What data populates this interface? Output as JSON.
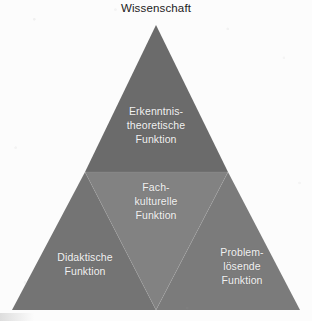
{
  "figure": {
    "title": "Wissenschaft",
    "shape": "triangle-pyramid",
    "background_color": "#fcfcfc",
    "title_color": "#222222",
    "label_color": "#f2f2f2",
    "regions": [
      {
        "id": "epistemic",
        "label": "Erkenntnis-\ntheoretische\nFunktion",
        "position": "top",
        "fill_color": "#6b6b6b"
      },
      {
        "id": "cultural",
        "label": "Fach-\nkulturelle\nFunktion",
        "position": "middle",
        "fill_color": "#828282"
      },
      {
        "id": "didactic",
        "label": "Didaktische\nFunktion",
        "position": "bottom-left",
        "fill_color": "#747474"
      },
      {
        "id": "problem",
        "label": "Problem-\nlösende\nFunktion",
        "position": "bottom-right",
        "fill_color": "#7b7b7b"
      }
    ],
    "geometry": {
      "apex": [
        156,
        25
      ],
      "base_left": [
        12,
        310
      ],
      "base_right": [
        300,
        310
      ],
      "midline_y": 172,
      "midline_left": [
        85,
        172
      ],
      "midline_right": [
        228,
        172
      ],
      "inner_vertex": [
        156,
        310
      ]
    }
  }
}
